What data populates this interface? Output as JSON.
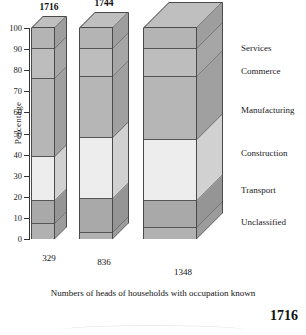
{
  "chart_data": {
    "type": "bar",
    "subtype": "stacked-3d-percentage",
    "title": "",
    "xlabel": "",
    "ylabel": "Percentage",
    "ylim": [
      0,
      100
    ],
    "ytick_values": [
      0,
      10,
      20,
      30,
      40,
      50,
      60,
      70,
      80,
      90,
      100
    ],
    "grid": false,
    "legend_position": "right",
    "categories": [
      "1716",
      "1744",
      "1795"
    ],
    "category_totals": [
      329,
      836,
      1348
    ],
    "series": [
      {
        "name": "Unclassified",
        "values": [
          7,
          3,
          5
        ]
      },
      {
        "name": "Transport",
        "values": [
          11,
          16,
          13
        ]
      },
      {
        "name": "Construction",
        "values": [
          21,
          29,
          29
        ]
      },
      {
        "name": "Manufacturing",
        "values": [
          37,
          29,
          30
        ]
      },
      {
        "name": "Commerce",
        "values": [
          14,
          13,
          13
        ]
      },
      {
        "name": "Services",
        "values": [
          10,
          10,
          10
        ]
      }
    ],
    "series_colors": [
      "#b0b0b0",
      "#a8a8a8",
      "#ececec",
      "#b5b5b5",
      "#bcbcbc",
      "#b2b2b2"
    ],
    "annotations": {
      "top_labels": [
        "1716",
        "1744",
        "1795"
      ],
      "bottom_labels": [
        "329",
        "836",
        "1348"
      ]
    }
  },
  "axis": {
    "y_title": "Percentage",
    "ticks": [
      "100",
      "90",
      "80",
      "70",
      "60",
      "50",
      "40",
      "30",
      "20",
      "10",
      "0"
    ]
  },
  "bars": [
    {
      "year": "1716",
      "count": "329",
      "segments": [
        {
          "label": "Services",
          "pct": 10,
          "color": "#b4b4b4"
        },
        {
          "label": "Commerce",
          "pct": 14,
          "color": "#bdbdbd"
        },
        {
          "label": "Manufacturing",
          "pct": 37,
          "color": "#b6b6b6"
        },
        {
          "label": "Construction",
          "pct": 21,
          "color": "#ededed"
        },
        {
          "label": "Transport",
          "pct": 11,
          "color": "#a9a9a9"
        },
        {
          "label": "Unclassified",
          "pct": 7,
          "color": "#b1b1b1"
        }
      ]
    },
    {
      "year": "1744",
      "count": "836",
      "segments": [
        {
          "label": "Services",
          "pct": 10,
          "color": "#b4b4b4"
        },
        {
          "label": "Commerce",
          "pct": 13,
          "color": "#bdbdbd"
        },
        {
          "label": "Manufacturing",
          "pct": 29,
          "color": "#b6b6b6"
        },
        {
          "label": "Construction",
          "pct": 29,
          "color": "#ededed"
        },
        {
          "label": "Transport",
          "pct": 16,
          "color": "#a9a9a9"
        },
        {
          "label": "Unclassified",
          "pct": 3,
          "color": "#b1b1b1"
        }
      ]
    },
    {
      "year": "1795",
      "count": "1348",
      "segments": [
        {
          "label": "Services",
          "pct": 10,
          "color": "#b4b4b4"
        },
        {
          "label": "Commerce",
          "pct": 13,
          "color": "#bdbdbd"
        },
        {
          "label": "Manufacturing",
          "pct": 30,
          "color": "#b6b6b6"
        },
        {
          "label": "Construction",
          "pct": 29,
          "color": "#ededed"
        },
        {
          "label": "Transport",
          "pct": 13,
          "color": "#a9a9a9"
        },
        {
          "label": "Unclassified",
          "pct": 5,
          "color": "#b1b1b1"
        }
      ]
    }
  ],
  "category_labels": [
    {
      "label": "Services",
      "y": 48
    },
    {
      "label": "Commerce",
      "y": 71
    },
    {
      "label": "Manufacturing",
      "y": 110
    },
    {
      "label": "Construction",
      "y": 153
    },
    {
      "label": "Transport",
      "y": 190
    },
    {
      "label": "Unclassified",
      "y": 222
    }
  ],
  "caption": "Numbers of heads of households with occupation known",
  "page_number": "1716"
}
